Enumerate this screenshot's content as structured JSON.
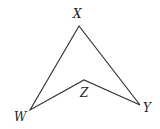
{
  "diagram": {
    "type": "concave quadrilateral (dart)",
    "vertices": [
      {
        "name": "X",
        "x": 79,
        "y": 26,
        "label_x": 73,
        "label_y": 18
      },
      {
        "name": "Y",
        "x": 140,
        "y": 105,
        "label_x": 143,
        "label_y": 112
      },
      {
        "name": "Z",
        "x": 84,
        "y": 80,
        "label_x": 80,
        "label_y": 97
      },
      {
        "name": "W",
        "x": 30,
        "y": 110,
        "label_x": 14,
        "label_y": 121
      }
    ],
    "edges": [
      [
        "W",
        "X"
      ],
      [
        "X",
        "Y"
      ],
      [
        "Y",
        "Z"
      ],
      [
        "Z",
        "W"
      ]
    ],
    "stroke_color": "#333333"
  }
}
